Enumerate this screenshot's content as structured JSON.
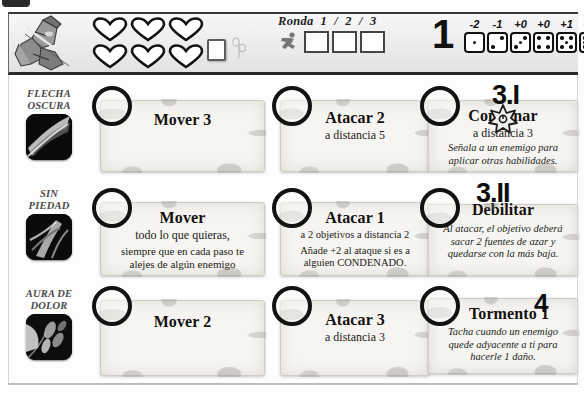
{
  "header": {
    "hero_icon": "archer-ranger-portrait",
    "health": {
      "icon": "heart-icon",
      "total": 6,
      "filled": 0
    },
    "hp_box_icon": "empty-token-box",
    "sprout_icon": "sprout-icon",
    "ronda": {
      "label": "Ronda",
      "numbers": "1 / 2 / 3",
      "runner_icon": "running-figure-icon",
      "boxes": [
        "",
        "",
        ""
      ]
    },
    "initiative": "1",
    "dice": [
      {
        "modifier": "-2",
        "pips": 1
      },
      {
        "modifier": "-1",
        "pips": 2
      },
      {
        "modifier": "+0",
        "pips": 3
      },
      {
        "modifier": "+0",
        "pips": 4
      },
      {
        "modifier": "+1",
        "pips": 5
      },
      {
        "modifier": "+2",
        "pips": 6
      }
    ]
  },
  "rows": [
    {
      "label_line1": "Flecha",
      "label_line2": "Oscura",
      "portrait_icon": "dark-arrow-portrait",
      "cards": [
        {
          "title": "Mover 3",
          "subtitle": "",
          "body": "",
          "extra": "",
          "badge": "",
          "badge_icon": ""
        },
        {
          "title": "Atacar 2",
          "subtitle": "a distancia 5",
          "body": "",
          "extra": "",
          "badge": "",
          "badge_icon": ""
        },
        {
          "title": "Condenar",
          "subtitle": "a distancia 3",
          "body": "Señala a un enemigo para aplicar otras habilidades.",
          "extra": "",
          "badge": "3.I",
          "badge_icon": "star-burst-icon"
        }
      ]
    },
    {
      "label_line1": "Sin",
      "label_line2": "Piedad",
      "portrait_icon": "merciless-portrait",
      "cards": [
        {
          "title": "Mover",
          "subtitle": "todo lo que quieras,",
          "body": "",
          "extra": "siempre que en cada paso te alejes de algún enemigo",
          "badge": "",
          "badge_icon": ""
        },
        {
          "title": "Atacar 1",
          "subtitle": "a 2 objetivos a distancia 2",
          "body": "",
          "extra": "Añade +2 al ataque si es a alguien CONDENADO.",
          "badge": "",
          "badge_icon": ""
        },
        {
          "title": "Debilitar",
          "subtitle": "",
          "body": "Al atacar, el objetivo deberá sacar 2 fuentes de azar y quedarse con la más baja.",
          "extra": "",
          "badge": "3.II",
          "badge_icon": ""
        }
      ]
    },
    {
      "label_line1": "Aura de",
      "label_line2": "Dolor",
      "portrait_icon": "pain-aura-portrait",
      "cards": [
        {
          "title": "Mover 2",
          "subtitle": "",
          "body": "",
          "extra": "",
          "badge": "",
          "badge_icon": ""
        },
        {
          "title": "Atacar 3",
          "subtitle": "a distancia 3",
          "body": "",
          "extra": "",
          "badge": "",
          "badge_icon": ""
        },
        {
          "title": "Tormento 1",
          "subtitle": "",
          "body": "Tacha cuando un enemigo quede adyacente a ti para hacerle 1 daño.",
          "extra": "",
          "badge": "4",
          "badge_icon": ""
        }
      ]
    }
  ],
  "colors": {
    "ink": "#14110e",
    "parchment": "#f6f5f2",
    "border": "#2b2b2b",
    "label_gray": "#4a4a4a"
  }
}
